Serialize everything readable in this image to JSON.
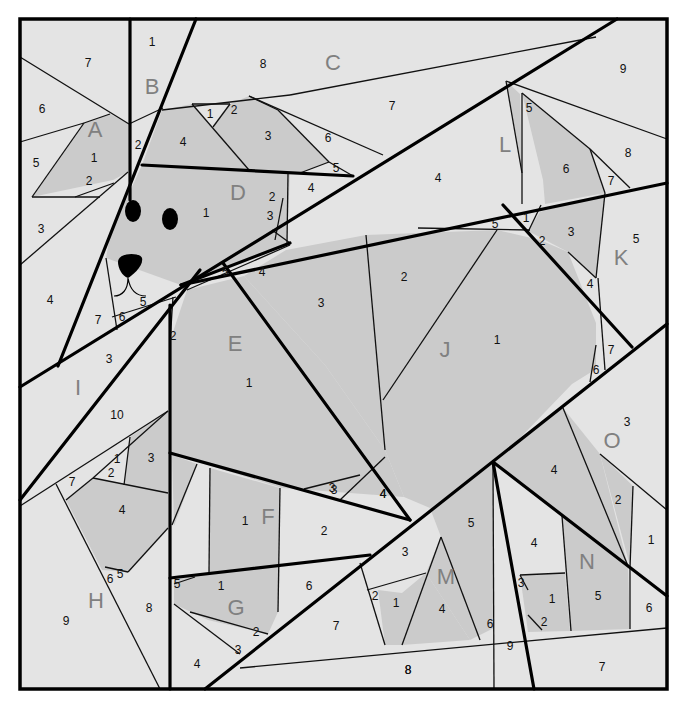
{
  "diagram": {
    "colors": {
      "light_fabric": "#e4e4e4",
      "dark_fabric": "#cbcbcb",
      "line": "#000000",
      "section_letter": "#808080",
      "background": "#ffffff"
    },
    "sections": [
      {
        "letter": "A",
        "x": 95,
        "y": 129,
        "pieces": [
          {
            "n": "1",
            "x": 94,
            "y": 158
          },
          {
            "n": "2",
            "x": 89,
            "y": 181
          },
          {
            "n": "3",
            "x": 41,
            "y": 229
          },
          {
            "n": "4",
            "x": 50,
            "y": 300
          },
          {
            "n": "5",
            "x": 36,
            "y": 163
          },
          {
            "n": "6",
            "x": 42,
            "y": 109
          },
          {
            "n": "7",
            "x": 88,
            "y": 63
          }
        ]
      },
      {
        "letter": "B",
        "x": 152,
        "y": 86,
        "pieces": [
          {
            "n": "1",
            "x": 152,
            "y": 42
          },
          {
            "n": "2",
            "x": 138,
            "y": 145
          }
        ]
      },
      {
        "letter": "C",
        "x": 333,
        "y": 62,
        "pieces": [
          {
            "n": "1",
            "x": 210,
            "y": 114
          },
          {
            "n": "2",
            "x": 234,
            "y": 110
          },
          {
            "n": "3",
            "x": 268,
            "y": 136
          },
          {
            "n": "4",
            "x": 183,
            "y": 142
          },
          {
            "n": "5",
            "x": 336,
            "y": 168
          },
          {
            "n": "6",
            "x": 328,
            "y": 138
          },
          {
            "n": "7",
            "x": 392,
            "y": 106
          },
          {
            "n": "8",
            "x": 263,
            "y": 64
          }
        ]
      },
      {
        "letter": "D",
        "x": 238,
        "y": 192,
        "pieces": [
          {
            "n": "1",
            "x": 206,
            "y": 213
          },
          {
            "n": "2",
            "x": 272,
            "y": 197
          },
          {
            "n": "3",
            "x": 270,
            "y": 216
          },
          {
            "n": "4",
            "x": 311,
            "y": 188
          },
          {
            "n": "5",
            "x": 143,
            "y": 302
          },
          {
            "n": "6",
            "x": 122,
            "y": 317
          },
          {
            "n": "7",
            "x": 98,
            "y": 320
          }
        ]
      },
      {
        "letter": "E",
        "x": 235,
        "y": 343,
        "pieces": [
          {
            "n": "1",
            "x": 249,
            "y": 383
          },
          {
            "n": "2",
            "x": 173,
            "y": 336
          },
          {
            "n": "3",
            "x": 321,
            "y": 303
          },
          {
            "n": "4",
            "x": 262,
            "y": 272
          },
          {
            "n": "5",
            "x": 225,
            "y": 272
          }
        ]
      },
      {
        "letter": "F",
        "x": 268,
        "y": 516,
        "pieces": [
          {
            "n": "1",
            "x": 245,
            "y": 521
          },
          {
            "n": "2",
            "x": 324,
            "y": 531
          },
          {
            "n": "3",
            "x": 334,
            "y": 490
          },
          {
            "n": "4",
            "x": 383,
            "y": 494
          }
        ]
      },
      {
        "letter": "G",
        "x": 236,
        "y": 607,
        "pieces": [
          {
            "n": "1",
            "x": 221,
            "y": 586
          },
          {
            "n": "2",
            "x": 256,
            "y": 632
          },
          {
            "n": "3",
            "x": 238,
            "y": 650
          },
          {
            "n": "4",
            "x": 197,
            "y": 664
          },
          {
            "n": "5",
            "x": 177,
            "y": 584
          },
          {
            "n": "6",
            "x": 309,
            "y": 586
          },
          {
            "n": "7",
            "x": 336,
            "y": 626
          },
          {
            "n": "8",
            "x": 408,
            "y": 670
          }
        ]
      },
      {
        "letter": "H",
        "x": 96,
        "y": 600,
        "pieces": [
          {
            "n": "1",
            "x": 117,
            "y": 459
          },
          {
            "n": "2",
            "x": 111,
            "y": 473
          },
          {
            "n": "3",
            "x": 151,
            "y": 458
          },
          {
            "n": "4",
            "x": 122,
            "y": 510
          },
          {
            "n": "5",
            "x": 120,
            "y": 574
          },
          {
            "n": "6",
            "x": 110,
            "y": 579
          },
          {
            "n": "7",
            "x": 72,
            "y": 482
          },
          {
            "n": "8",
            "x": 149,
            "y": 608
          },
          {
            "n": "9",
            "x": 66,
            "y": 621
          }
        ]
      },
      {
        "letter": "I",
        "x": 78,
        "y": 387,
        "pieces": [
          {
            "n": "3",
            "x": 109,
            "y": 359
          },
          {
            "n": "10",
            "x": 117,
            "y": 415
          }
        ]
      },
      {
        "letter": "J",
        "x": 445,
        "y": 349,
        "pieces": [
          {
            "n": "1",
            "x": 497,
            "y": 340
          },
          {
            "n": "2",
            "x": 404,
            "y": 277
          },
          {
            "n": "3",
            "x": 332,
            "y": 488
          },
          {
            "n": "4",
            "x": 383,
            "y": 494
          },
          {
            "n": "5",
            "x": 495,
            "y": 224
          }
        ]
      },
      {
        "letter": "K",
        "x": 621,
        "y": 257,
        "pieces": [
          {
            "n": "1",
            "x": 526,
            "y": 218
          },
          {
            "n": "2",
            "x": 542,
            "y": 241
          },
          {
            "n": "3",
            "x": 571,
            "y": 232
          },
          {
            "n": "4",
            "x": 590,
            "y": 284
          },
          {
            "n": "5",
            "x": 636,
            "y": 239
          },
          {
            "n": "6",
            "x": 596,
            "y": 370
          },
          {
            "n": "7",
            "x": 611,
            "y": 350
          }
        ]
      },
      {
        "letter": "L",
        "x": 505,
        "y": 144,
        "pieces": [
          {
            "n": "4",
            "x": 438,
            "y": 178
          },
          {
            "n": "5",
            "x": 529,
            "y": 108
          },
          {
            "n": "6",
            "x": 566,
            "y": 169
          },
          {
            "n": "7",
            "x": 611,
            "y": 181
          },
          {
            "n": "8",
            "x": 628,
            "y": 153
          },
          {
            "n": "9",
            "x": 623,
            "y": 69
          }
        ]
      },
      {
        "letter": "M",
        "x": 446,
        "y": 576,
        "pieces": [
          {
            "n": "1",
            "x": 396,
            "y": 603
          },
          {
            "n": "2",
            "x": 375,
            "y": 596
          },
          {
            "n": "3",
            "x": 405,
            "y": 552
          },
          {
            "n": "4",
            "x": 442,
            "y": 609
          },
          {
            "n": "5",
            "x": 471,
            "y": 523
          },
          {
            "n": "6",
            "x": 490,
            "y": 624
          },
          {
            "n": "8",
            "x": 408,
            "y": 670
          },
          {
            "n": "9",
            "x": 510,
            "y": 646
          }
        ]
      },
      {
        "letter": "N",
        "x": 587,
        "y": 561,
        "pieces": [
          {
            "n": "1",
            "x": 552,
            "y": 599
          },
          {
            "n": "2",
            "x": 544,
            "y": 622
          },
          {
            "n": "3",
            "x": 521,
            "y": 583
          },
          {
            "n": "4",
            "x": 534,
            "y": 543
          },
          {
            "n": "5",
            "x": 598,
            "y": 596
          },
          {
            "n": "6",
            "x": 649,
            "y": 608
          },
          {
            "n": "7",
            "x": 602,
            "y": 667
          }
        ]
      },
      {
        "letter": "O",
        "x": 612,
        "y": 440,
        "pieces": [
          {
            "n": "1",
            "x": 651,
            "y": 540
          },
          {
            "n": "2",
            "x": 618,
            "y": 500
          },
          {
            "n": "3",
            "x": 627,
            "y": 422
          },
          {
            "n": "4",
            "x": 554,
            "y": 470
          }
        ]
      }
    ]
  }
}
